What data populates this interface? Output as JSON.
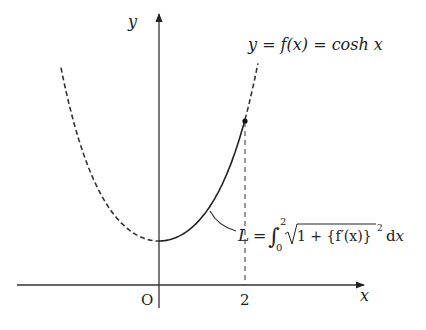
{
  "diagram": {
    "type": "function-plot",
    "function_label": "y = f(x) = cosh x",
    "axes": {
      "x_label": "x",
      "y_label": "y",
      "origin_label": "O",
      "x_tick_label": "2"
    },
    "formula": {
      "lhs": "L",
      "eq": "=",
      "integral_upper": "2",
      "integral_lower": "0",
      "integrand": "1 + {f′(x)}",
      "power": "2",
      "differential": "dx"
    }
  },
  "chart_data": {
    "type": "line",
    "title": "y = f(x) = cosh x",
    "xlabel": "x",
    "ylabel": "y",
    "series": [
      {
        "name": "cosh x (dashed, x<0)",
        "x": [
          -2.28,
          -2,
          -1.5,
          -1,
          -0.5,
          0
        ],
        "y": [
          4.94,
          3.76,
          2.35,
          1.54,
          1.13,
          1.0
        ]
      },
      {
        "name": "cosh x (solid arc, 0≤x≤2)",
        "x": [
          0,
          0.5,
          1,
          1.5,
          2
        ],
        "y": [
          1.0,
          1.13,
          1.54,
          2.35,
          3.76
        ]
      },
      {
        "name": "cosh x (dashed, x>2)",
        "x": [
          2,
          2.2,
          2.3
        ],
        "y": [
          3.76,
          4.57,
          5.04
        ]
      }
    ],
    "annotations": [
      "L = ∫₀² √(1 + {f′(x)}²) dx",
      "point at (2, cosh 2)",
      "O",
      "2"
    ],
    "grid": false
  }
}
